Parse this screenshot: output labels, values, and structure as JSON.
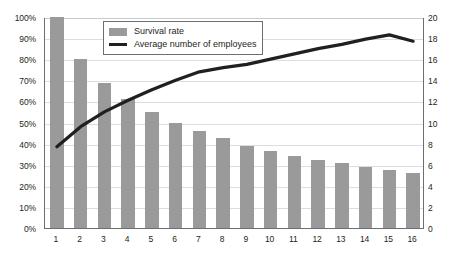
{
  "chart_data": {
    "type": "bar",
    "title": "",
    "subtitle": "",
    "xlabel": "",
    "ylabel": "",
    "categories": [
      "1",
      "2",
      "3",
      "4",
      "5",
      "6",
      "7",
      "8",
      "9",
      "10",
      "11",
      "12",
      "13",
      "14",
      "15",
      "16"
    ],
    "series": [
      {
        "name": "Survival rate",
        "type": "bar",
        "axis": "left",
        "color": "#9a9a9a",
        "values": [
          100,
          80,
          68.5,
          61,
          55,
          50,
          46,
          42.5,
          39,
          36.5,
          34,
          32,
          31,
          29,
          27.5,
          26
        ]
      },
      {
        "name": "Average number of employees",
        "type": "line",
        "axis": "right",
        "color": "#231f20",
        "values": [
          7.8,
          9.7,
          11.1,
          12.2,
          13.2,
          14.1,
          14.9,
          15.3,
          15.6,
          16.1,
          16.6,
          17.1,
          17.5,
          18.0,
          18.4,
          17.8
        ]
      }
    ],
    "left_axis": {
      "min": 0,
      "max": 100,
      "step": 10,
      "suffix": "%",
      "ticks": [
        "0%",
        "10%",
        "20%",
        "30%",
        "40%",
        "50%",
        "60%",
        "70%",
        "80%",
        "90%",
        "100%"
      ]
    },
    "right_axis": {
      "min": 0,
      "max": 20,
      "step": 2,
      "ticks": [
        "0",
        "2",
        "4",
        "6",
        "8",
        "10",
        "12",
        "14",
        "16",
        "18",
        "20"
      ]
    },
    "grid": true,
    "legend_position": "top-left-inside"
  },
  "legend": {
    "items": [
      {
        "label": "Survival rate",
        "swatch": "bar-swatch",
        "color": "#9a9a9a"
      },
      {
        "label": "Average number of employees",
        "swatch": "line-swatch",
        "color": "#231f20"
      }
    ]
  }
}
